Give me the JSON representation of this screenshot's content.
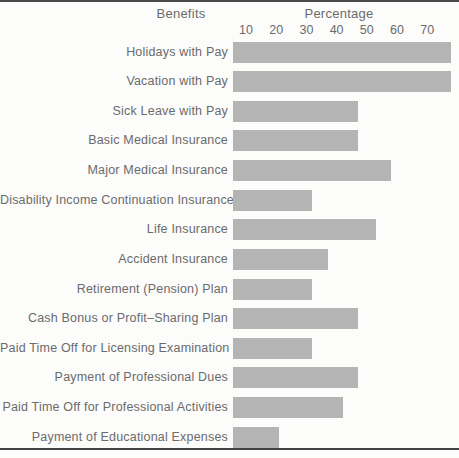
{
  "chart_data": {
    "type": "bar",
    "orientation": "horizontal",
    "title": "",
    "xlabel": "Percentage",
    "ylabel": "Benefits",
    "x_ticks": [
      10,
      20,
      30,
      40,
      50,
      60,
      70
    ],
    "xlim": [
      0,
      80
    ],
    "grid": false,
    "legend": false,
    "bar_color": "#b4b4b4",
    "categories": [
      "Holidays with Pay",
      "Vacation with Pay",
      "Sick Leave with Pay",
      "Basic Medical Insurance",
      "Major Medical Insurance",
      "Disability Income Continuation Insurance",
      "Life Insurance",
      "Accident Insurance",
      "Retirement (Pension) Plan",
      "Cash Bonus or Profit–Sharing Plan",
      "Paid Time Off for Licensing Examination",
      "Payment of Professional Dues",
      "Paid Time Off for Professional Activities",
      "Payment of Educational Expenses"
    ],
    "values": [
      78,
      78,
      47,
      47,
      58,
      32,
      53,
      37,
      32,
      47,
      32,
      47,
      42,
      21
    ]
  }
}
